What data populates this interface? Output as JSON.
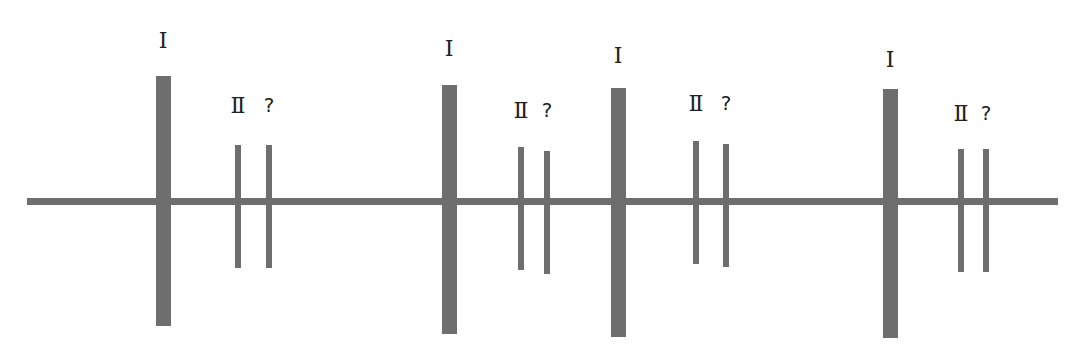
{
  "diagram": {
    "line_color": "#6e6e6e",
    "groups": [
      {
        "marks": [
          {
            "type": "thick",
            "label": "I"
          },
          {
            "type": "thin",
            "label": "Ⅱ"
          },
          {
            "type": "thin",
            "label": "?"
          }
        ]
      },
      {
        "marks": [
          {
            "type": "thick",
            "label": "I"
          },
          {
            "type": "thin",
            "label": "Ⅱ"
          },
          {
            "type": "thin",
            "label": "?"
          }
        ]
      },
      {
        "marks": [
          {
            "type": "thick",
            "label": "I"
          },
          {
            "type": "thin",
            "label": "Ⅱ"
          },
          {
            "type": "thin",
            "label": "?"
          }
        ]
      },
      {
        "marks": [
          {
            "type": "thick",
            "label": "I"
          },
          {
            "type": "thin",
            "label": "Ⅱ"
          },
          {
            "type": "thin",
            "label": "?"
          }
        ]
      }
    ]
  }
}
